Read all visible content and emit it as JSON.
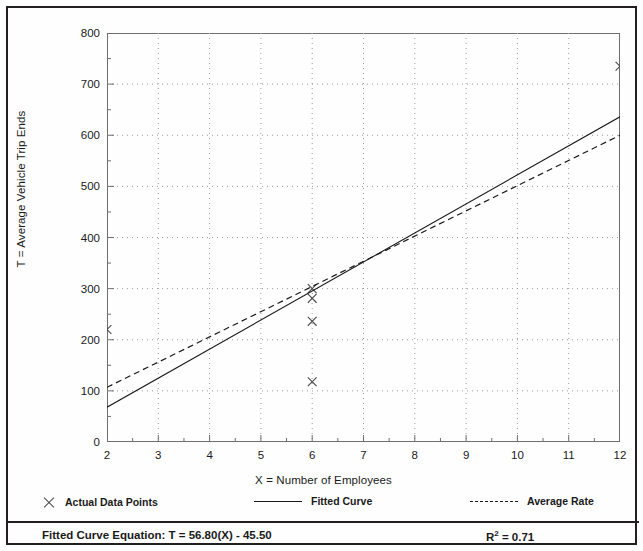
{
  "chart_data": {
    "type": "scatter",
    "title": "",
    "xlabel": "X = Number of Employees",
    "ylabel": "T = Average Vehicle Trip Ends",
    "xlim": [
      2,
      12
    ],
    "ylim": [
      0,
      800
    ],
    "xticks": [
      2,
      3,
      4,
      5,
      6,
      7,
      8,
      9,
      10,
      11,
      12
    ],
    "yticks": [
      0,
      100,
      200,
      300,
      400,
      500,
      600,
      700,
      800
    ],
    "xminor_step": 0.5,
    "yminor_step": 50,
    "grid": true,
    "grid_style": "dotted",
    "legend_position": "below-axes",
    "series": [
      {
        "name": "Actual Data Points",
        "type": "scatter",
        "marker": "x",
        "x": [
          2,
          6,
          6,
          6,
          6,
          12
        ],
        "y": [
          220,
          300,
          281,
          236,
          118,
          735
        ]
      },
      {
        "name": "Fitted Curve",
        "type": "line",
        "style": "solid",
        "x": [
          2,
          12
        ],
        "y": [
          68.1,
          636.1
        ],
        "equation": "T = 56.80(X) - 45.50",
        "slope": 56.8,
        "intercept": -45.5,
        "r_squared": 0.71
      },
      {
        "name": "Average Rate",
        "type": "line",
        "style": "dashed",
        "x": [
          2,
          12
        ],
        "y": [
          107,
          600
        ]
      }
    ]
  },
  "axes": {
    "y_title": "T = Average Vehicle Trip Ends",
    "x_title": "X = Number of Employees",
    "y_tick_labels": [
      "800",
      "700",
      "600",
      "500",
      "400",
      "300",
      "200",
      "100",
      "0"
    ],
    "x_tick_labels": [
      "2",
      "3",
      "4",
      "5",
      "6",
      "7",
      "8",
      "9",
      "10",
      "11",
      "12"
    ]
  },
  "legend": {
    "entries": [
      {
        "label": "Actual Data Points",
        "marker": "x-marker-icon"
      },
      {
        "label": "Fitted Curve",
        "marker": "solid-line-icon"
      },
      {
        "label": "Average Rate",
        "marker": "dashed-line-icon"
      }
    ]
  },
  "footer": {
    "equation_label": "Fitted Curve Equation:  T = 56.80(X) - 45.50",
    "r_squared_prefix": "R",
    "r_squared_exponent": "2",
    "r_squared_value": " = 0.71"
  },
  "colors": {
    "frame": "#231f20",
    "axis": "#6f6f6f",
    "grid": "#9a9a9a",
    "line": "#1a1a1a",
    "marker": "#4a4a4a"
  }
}
